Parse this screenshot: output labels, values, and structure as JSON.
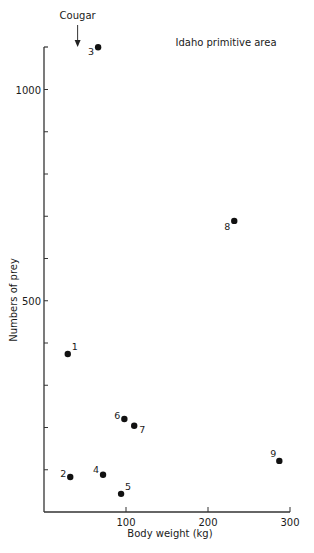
{
  "chart_data": {
    "type": "scatter",
    "title": "Idaho primitive area",
    "xlabel": "Body weight (kg)",
    "ylabel": "Numbers of prey",
    "xlim": [
      0,
      300
    ],
    "ylim": [
      0,
      1100
    ],
    "x_ticks": [
      100,
      200,
      300
    ],
    "x_tick_labels": [
      "100",
      "200",
      "300"
    ],
    "y_ticks": [
      100,
      200,
      300,
      400,
      500,
      600,
      700,
      800,
      900,
      1000
    ],
    "y_tick_labels": [
      "",
      "",
      "",
      "",
      "500",
      "",
      "",
      "",
      "",
      "1000"
    ],
    "grid": false,
    "legend": null,
    "points": [
      {
        "label": "1",
        "x": 29,
        "y": 374
      },
      {
        "label": "2",
        "x": 32,
        "y": 83
      },
      {
        "label": "3",
        "x": 66,
        "y": 1100
      },
      {
        "label": "4",
        "x": 72,
        "y": 88
      },
      {
        "label": "5",
        "x": 94,
        "y": 43
      },
      {
        "label": "6",
        "x": 98,
        "y": 220
      },
      {
        "label": "7",
        "x": 110,
        "y": 204
      },
      {
        "label": "8",
        "x": 232,
        "y": 689
      },
      {
        "label": "9",
        "x": 287,
        "y": 121
      }
    ],
    "annotations": [
      {
        "text": "Cougar",
        "x": 41,
        "type": "arrow-down"
      }
    ]
  },
  "labels": {
    "title": "Idaho primitive area",
    "xlabel": "Body weight (kg)",
    "ylabel": "Numbers of prey",
    "cougar": "Cougar"
  }
}
